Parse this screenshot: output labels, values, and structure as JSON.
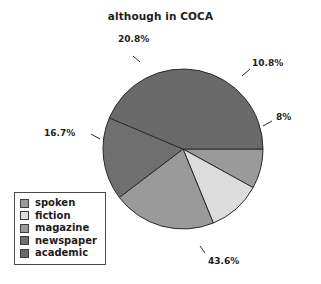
{
  "chart_data": {
    "type": "pie",
    "title": "although in COCA",
    "xlabel": "",
    "ylabel": "",
    "legend_position": "bottom-left",
    "start_angle_deg": 0,
    "direction": "clockwise",
    "categories": [
      "spoken",
      "fiction",
      "magazine",
      "newspaper",
      "academic"
    ],
    "values": [
      8,
      10.8,
      20.8,
      16.7,
      43.6
    ],
    "value_labels": [
      "8%",
      "10.8%",
      "20.8%",
      "16.7%",
      "43.6%"
    ],
    "colors": [
      "#9a9a9a",
      "#dcdcdc",
      "#9a9a9a",
      "#6f6f6f",
      "#6a6a6a"
    ],
    "slices": [
      {
        "label": "spoken",
        "value": 8,
        "display": "8%",
        "color": "#9a9a9a"
      },
      {
        "label": "fiction",
        "value": 10.8,
        "display": "10.8%",
        "color": "#dcdcdc"
      },
      {
        "label": "magazine",
        "value": 20.8,
        "display": "20.8%",
        "color": "#9a9a9a"
      },
      {
        "label": "newspaper",
        "value": 16.7,
        "display": "16.7%",
        "color": "#6f6f6f"
      },
      {
        "label": "academic",
        "value": 43.6,
        "display": "43.6%",
        "color": "#6a6a6a"
      }
    ]
  },
  "legend": {
    "items": [
      {
        "label": "spoken",
        "color": "#9a9a9a"
      },
      {
        "label": "fiction",
        "color": "#dcdcdc"
      },
      {
        "label": "magazine",
        "color": "#9a9a9a"
      },
      {
        "label": "newspaper",
        "color": "#6f6f6f"
      },
      {
        "label": "academic",
        "color": "#6a6a6a"
      }
    ]
  },
  "labels": {
    "spoken_pct": "8%",
    "fiction_pct": "10.8%",
    "magazine_pct": "20.8%",
    "newspaper_pct": "16.7%",
    "academic_pct": "43.6%"
  },
  "style": {
    "slice_outline": "#2a2a2a",
    "text_color": "#1d1d1d",
    "background": "#ffffff"
  }
}
